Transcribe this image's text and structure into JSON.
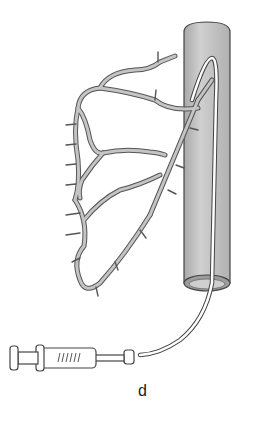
{
  "figure": {
    "panel_label": "d",
    "colors": {
      "vessel_fill": "#c4c4c4",
      "vessel_outline": "#555555",
      "tube_fill": "#bdbdbd",
      "catheter": "#ffffff",
      "background": "#ffffff"
    },
    "elements": [
      "large-vessel",
      "branching-arteries",
      "catheter",
      "syringe"
    ]
  }
}
